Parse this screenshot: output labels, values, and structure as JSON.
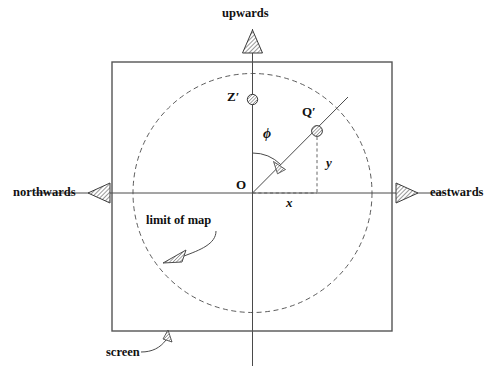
{
  "figure": {
    "background_color": "#ffffff",
    "line_color": "#3a3a3a",
    "text_color": "#111111"
  },
  "labels": {
    "upwards": "upwards",
    "northwards": "northwards",
    "eastwards": "eastwards",
    "screen": "screen",
    "limit_of_map": "limit of map",
    "origin": "O",
    "zenith_point": "Z′",
    "object_point": "Q′",
    "x_axis_component": "x",
    "y_axis_component": "y",
    "angle_phi": "ϕ"
  },
  "geometry": {
    "screen_rect": {
      "x": 112,
      "y": 62,
      "width": 280,
      "height": 269
    },
    "map_circle": {
      "cx": 252.5,
      "cy": 193,
      "r": 119.5,
      "dashed": true
    },
    "origin": {
      "x": 252.5,
      "y": 193
    },
    "z_prime_marker": {
      "x": 252.5,
      "y": 99.5,
      "r": 5.2
    },
    "q_prime_marker": {
      "x": 317,
      "y": 131,
      "r": 5.4
    },
    "radial_line": {
      "x1": 252.5,
      "y1": 193,
      "x2": 348,
      "y2": 97
    },
    "vertical_axis": {
      "x": 252.5,
      "y1": 29,
      "y2": 366
    },
    "horizontal_axis": {
      "y": 193,
      "x1": 35,
      "x2": 445
    },
    "phi_arc_radius": 40
  },
  "arrows": {
    "upwards_arrow": {
      "x": 252.5,
      "y": 34,
      "direction": "up",
      "hatched": true
    },
    "northwards_arrow": {
      "x": 99,
      "y": 193,
      "direction": "left",
      "hatched": true
    },
    "eastwards_arrow": {
      "x": 406,
      "y": 193,
      "direction": "right",
      "hatched": true
    },
    "phi_arrow": {
      "x": 290,
      "y": 165,
      "hatched": true
    },
    "limit_arrow": {
      "x": 172,
      "y": 258,
      "hatched": true
    },
    "screen_arrow": {
      "x": 169,
      "y": 340,
      "hatched": true
    }
  },
  "label_positions": {
    "upwards": {
      "x": 222,
      "y": 8
    },
    "northwards": {
      "x": 14,
      "y": 187
    },
    "eastwards": {
      "x": 429,
      "y": 187
    },
    "screen": {
      "x": 107,
      "y": 353
    },
    "limit_of_map": {
      "x": 147,
      "y": 215
    },
    "origin": {
      "x": 237,
      "y": 182
    },
    "z_prime": {
      "x": 228,
      "y": 91
    },
    "q_prime": {
      "x": 303,
      "y": 106
    },
    "x_component": {
      "x": 286,
      "y": 198
    },
    "y_component": {
      "x": 325,
      "y": 157
    },
    "phi": {
      "x": 263,
      "y": 128
    }
  }
}
